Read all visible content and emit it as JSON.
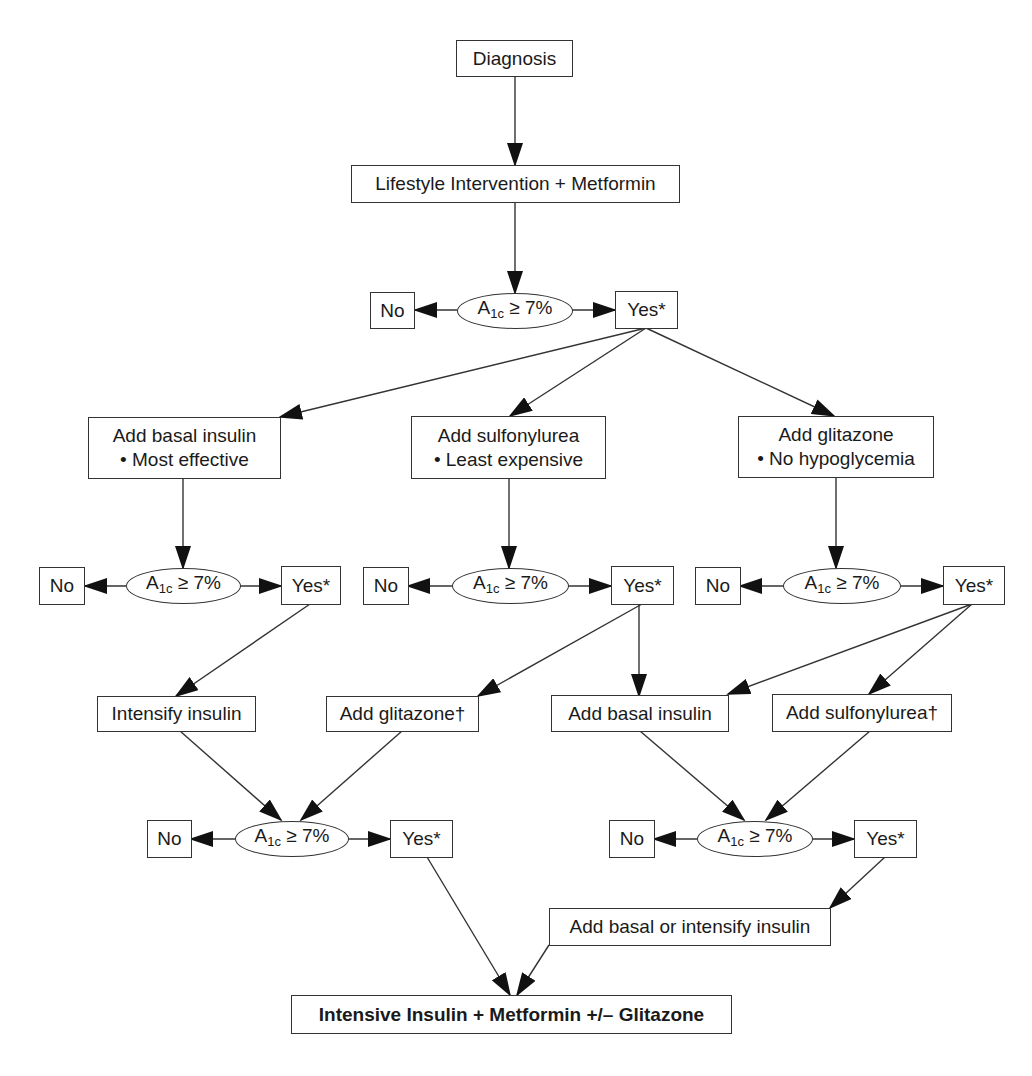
{
  "diagram": {
    "colors": {
      "stroke": "#333333",
      "arrow": "#111111",
      "background": "#ffffff",
      "text": "#1a1a1a"
    },
    "start": {
      "label": "Diagnosis"
    },
    "step1": {
      "label": "Lifestyle Intervention + Metformin"
    },
    "decision_label": {
      "prefix": "A",
      "subscript": "1c",
      "suffix": " ≥ 7%"
    },
    "no_label": "No",
    "yes_label": "Yes*",
    "options": [
      {
        "title": "Add basal insulin",
        "bullet": "• Most effective"
      },
      {
        "title": "Add sulfonylurea",
        "bullet": "• Least expensive"
      },
      {
        "title": "Add glitazone",
        "bullet": "• No hypoglycemia"
      }
    ],
    "tier3": {
      "intensify_insulin": "Intensify insulin",
      "add_glitazone": "Add glitazone†",
      "add_basal_insulin": "Add basal insulin",
      "add_sulfonylurea": "Add sulfonylurea†"
    },
    "tier4": {
      "add_basal_or_intensify": "Add basal or intensify insulin"
    },
    "final": {
      "label": "Intensive Insulin + Metformin +/– Glitazone"
    }
  }
}
